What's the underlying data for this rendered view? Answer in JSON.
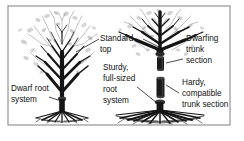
{
  "figure": {
    "background_color": "#ffffff",
    "frame_color": "#8a8a8a",
    "ink_color": "#111111",
    "canopy_tint_color": "#9a9a9a",
    "frame": {
      "x": 8,
      "y": 6,
      "width": 222,
      "height": 119
    }
  },
  "labels": {
    "standard_top": {
      "lines": [
        "Standard",
        "top"
      ],
      "line1": "Standard",
      "line2": "top",
      "x": 100,
      "y": 40
    },
    "dwarfing_trunk_section": {
      "lines": [
        "Dwarfing",
        "trunk",
        "section"
      ],
      "line1": "Dwarfing",
      "line2": "trunk",
      "line3": "section",
      "x": 186,
      "y": 40
    },
    "dwarf_root_system": {
      "lines": [
        "Dwarf root",
        "system"
      ],
      "line1": "Dwarf root",
      "line2": "system",
      "x": 10,
      "y": 89
    },
    "sturdy_full_sized_root_system": {
      "lines": [
        "Sturdy,",
        "full-sized",
        "root",
        "system"
      ],
      "line1": "Sturdy,",
      "line2": "full-sized",
      "line3": "root",
      "line4": "system",
      "x": 103,
      "y": 71
    },
    "hardy_compatible_trunk_section": {
      "lines": [
        "Hardy,",
        "compatible",
        "trunk section"
      ],
      "line1": "Hardy,",
      "line2": "compatible",
      "line3": "trunk section",
      "x": 182,
      "y": 85
    }
  },
  "trees": {
    "left": {
      "name": "dwarf-rootstock-tree",
      "description": "Bare deciduous tree with standard top grafted onto a dwarf root system",
      "center_x": 62,
      "ground_y": 116,
      "root_spread": 44
    },
    "right": {
      "name": "interstem-tree",
      "description": "Bare deciduous tree with standard top, dwarfing trunk section, hardy compatible trunk section and sturdy full-sized root system",
      "center_x": 160,
      "ground_y": 116,
      "root_spread": 62
    }
  },
  "graft_sections": {
    "dwarfing_trunk": {
      "x": 157,
      "y": 57,
      "width": 7,
      "height": 13
    },
    "hardy_trunk": {
      "x": 157,
      "y": 78,
      "width": 8,
      "height": 19
    }
  }
}
